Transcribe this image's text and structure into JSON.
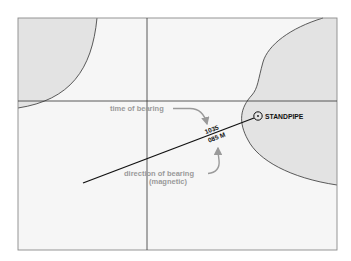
{
  "diagram": {
    "type": "chart-plot-bearing-line",
    "colors": {
      "land_fill": "#e6e6e6",
      "water_fill": "#f6f6f6",
      "frame_stroke": "#8a8a8a",
      "grid_stroke": "#333333",
      "bearing_line": "#111111",
      "annotation_gray": "#9a9a9a"
    },
    "landmark": {
      "symbol": "circle-dot",
      "label": "STANDPIPE"
    },
    "bearing_label": {
      "time": "1035",
      "direction": "085 M"
    },
    "annotations": {
      "time_of_bearing": "time of bearing",
      "direction_of_bearing": "direction of bearing",
      "direction_qualifier": "(magnetic)"
    }
  }
}
